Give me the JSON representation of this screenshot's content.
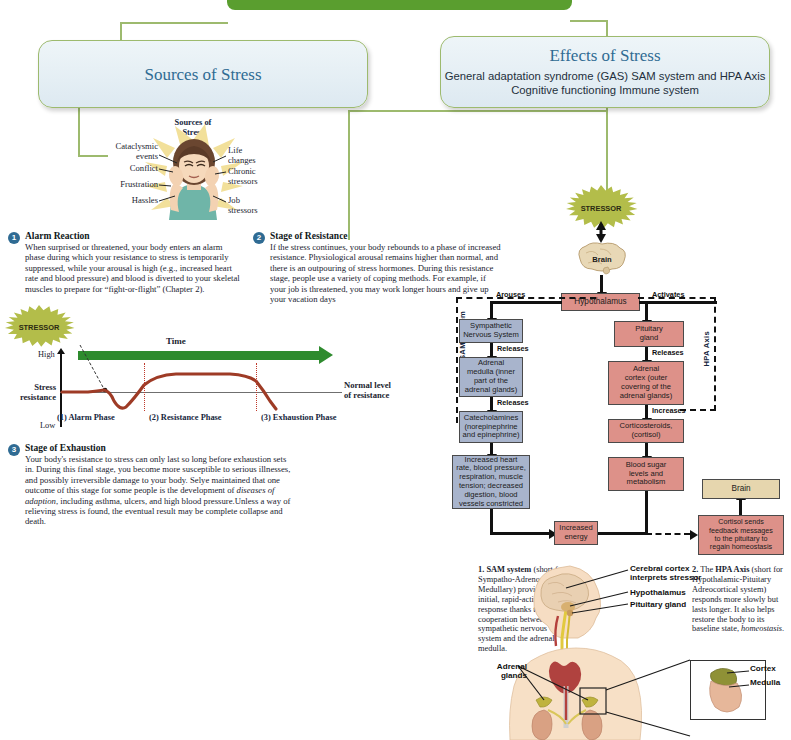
{
  "banner": {
    "title": "Stress"
  },
  "sources_panel": {
    "title": "Sources of Stress",
    "art_caption": "Sources of\nStress",
    "labels_left": [
      "Cataclysmic\nevents",
      "Conflict",
      "Frustration",
      "Hassles"
    ],
    "labels_right": [
      "Life\nchanges",
      "Chronic\nstressors",
      "Job\nstressors"
    ]
  },
  "effects_panel": {
    "title": "Effects of Stress",
    "subtitle": "General adaptation syndrome (GAS) SAM system and HPA Axis Cognitive functioning Immune system"
  },
  "stages": [
    {
      "num": "1",
      "title": "Alarm Reaction",
      "text": "When surprised or threatened, your body enters an alarm phase during which your resistance to stress is temporarily suppressed, while your arousal is high (e.g., increased heart rate and blood pressure) and blood is diverted to your skeletal muscles to prepare for “fight-or-flight” (Chapter 2)."
    },
    {
      "num": "2",
      "title": "Stage of Resistance",
      "text": "If the stress continues, your body rebounds to a phase of increased resistance. Physiological arousal remains higher than normal, and there is an outpouring of stress hormones. During this resistance stage, people use a variety of coping methods. For example, if your job is threatened, you may work longer hours and give up your vacation days"
    },
    {
      "num": "3",
      "title": "Stage of Exhaustion",
      "text_part1": "Your body's resistance to stress can only last so long before exhaustion sets in. During this final stage, you become more susceptible to serious illnesses, and possibly irreversible damage to your body. Selye maintained that one outcome of this stage for some people is the development of ",
      "text_italic": "diseases of adaption",
      "text_part2": ", including asthma, ulcers, and high blood pressure.Unless a way of relieving  stress is found, the eventual result may be complete collapse and death."
    }
  ],
  "gas_graph": {
    "type": "line",
    "stressor_label": "STRESSOR",
    "time_label": "Time",
    "y_axis_label": "Stress\nresistance",
    "y_high": "High",
    "y_low": "Low",
    "baseline_label": "Normal level\nof resistance",
    "phases": [
      "(1) Alarm Phase",
      "(2) Resistance Phase",
      "(3) Exhaustion Phase"
    ],
    "series_name": "Stress resistance over time",
    "x": [
      0,
      8,
      16,
      22,
      28,
      34,
      42,
      52,
      64,
      76,
      84,
      90,
      96,
      100
    ],
    "y": [
      0,
      0,
      3,
      -2,
      -18,
      -10,
      14,
      22,
      24,
      24,
      23,
      18,
      2,
      -22
    ],
    "ylim": [
      -40,
      40
    ],
    "grid": false
  },
  "flowchart": {
    "stressor": "STRESSOR",
    "brain": "Brain",
    "hypothalamus": "Hypothalamus",
    "arouses": "Arouses",
    "activates": "Activates",
    "sam_axis_label": "SAM System",
    "hpa_axis_label": "HPA Axis",
    "left_branch": [
      {
        "text": "Sympathetic\nNervous System",
        "edge": "Activates"
      },
      {
        "text": "Adrenal\nmedulla (inner\npart of the\nadrenal glands)",
        "edge": "Releases"
      },
      {
        "text": "Catecholamines\n(norepinephrine\nand epinephrine)",
        "edge": ""
      },
      {
        "text": "Increased heart\nrate, blood pressure,\nrespiration, muscle\ntension; decreased\ndigestion, blood\nvessels constricted",
        "edge": ""
      }
    ],
    "right_branch": [
      {
        "text": "Pituitary\ngland",
        "edge": "Activates"
      },
      {
        "text": "Adrenal\ncortex (outer\ncovering of the\nadrenal glands)",
        "edge": "Releases"
      },
      {
        "text": "Corticosteroids,\n(cortisol)",
        "edge": "Increases"
      },
      {
        "text": "Blood sugar\nlevels and\nmetabolism",
        "edge": ""
      }
    ],
    "increased_energy": "Increased\nenergy",
    "feedback_box": "Cortisol sends\nfeedback messages\nto the pituitary to\nregain homeostasis",
    "feedback_brain": "Brain"
  },
  "explainers": [
    {
      "num": "1.",
      "bold": "SAM system",
      "rest": " (short for Sympatho-Adreno-Medullary) provides an initial, rapid-acting stress response thanks to cooperation between the sympathetic nervous system and the adrenal medulla."
    },
    {
      "num": "2.",
      "lead": "The ",
      "bold": "HPA Axis",
      "rest": " (short for Hypothalamic-Pituitary Adreocortical system) responds more slowly but lasts longer. It also helps restore the body to its baseline state, ",
      "italic": "homeostasis",
      "tail": "."
    }
  ],
  "anatomy": {
    "head_labels": [
      "Cerebral cortex\ninterprets stressor",
      "Hypothalamus",
      "Pituitary gland"
    ],
    "adrenal_label": "Adrenal\nglands",
    "inset_labels": [
      "Cortex",
      "Medulla"
    ]
  },
  "colors": {
    "banner_green": "#5a9e2f",
    "panel_border": "#9dba6e",
    "panel_title": "#2f6b93",
    "node_blue": "#a8b4cc",
    "node_red": "#dd9189",
    "node_tan": "#e6d6ae",
    "burst_olive": "#b3bd4a",
    "curve_red": "#9e3b26",
    "time_green": "#2e8b2e"
  }
}
